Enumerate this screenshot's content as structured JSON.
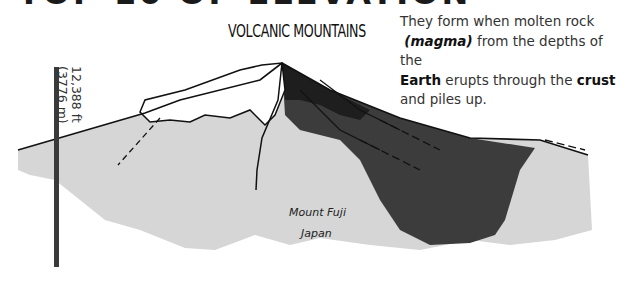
{
  "header": {
    "cropped_heading": "TOP 10 OF ELEVATION"
  },
  "section": {
    "title": "VOLCANIC MOUNTAINS"
  },
  "description": {
    "line1": "They form when molten rock",
    "magma": "(magma)",
    "line2_rest": " from the depths of the",
    "earth": "Earth",
    "line3_mid": " erupts through the ",
    "crust": "crust",
    "line4": "and piles up."
  },
  "scale": {
    "feet": "12,388 ft",
    "meters": "(3776 m)"
  },
  "mountain": {
    "name": "Mount Fuji",
    "country": "Japan"
  },
  "colors": {
    "light_gray": "#d6d6d6",
    "dark": "#3c3c3c",
    "black": "#1e1e1e",
    "bar": "#3a3a3a"
  }
}
